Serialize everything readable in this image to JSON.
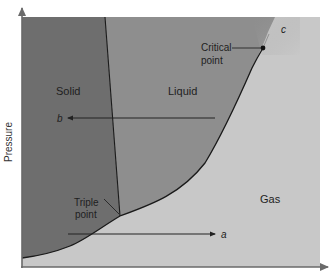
{
  "diagram": {
    "type": "phase diagram",
    "axes": {
      "y_label": "Pressure",
      "x_label": ""
    },
    "regions": [
      {
        "name": "solid",
        "label": "Solid",
        "color": "#6e6e6e"
      },
      {
        "name": "liquid",
        "label": "Liquid",
        "color": "#8e8e8e"
      },
      {
        "name": "gas",
        "label": "Gas",
        "color": "#c8c8c8"
      }
    ],
    "points": {
      "critical": {
        "label_line1": "Critical",
        "label_line2": "point"
      },
      "triple": {
        "label_line1": "Triple",
        "label_line2": "point"
      }
    },
    "paths": {
      "a": {
        "label": "a",
        "direction": "left-to-right"
      },
      "b": {
        "label": "b",
        "direction": "right-to-left"
      },
      "c": {
        "label": "c"
      }
    },
    "colors": {
      "axis": "#6a6a6a",
      "curve": "#1a1a1a",
      "arrow": "#222222"
    }
  }
}
